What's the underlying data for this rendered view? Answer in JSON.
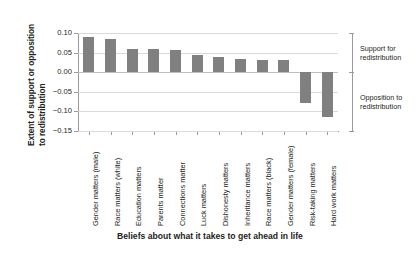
{
  "chart_data": {
    "type": "bar",
    "title": "",
    "subtitle": "",
    "xlabel": "Beliefs about what it takes to get ahead in life",
    "ylabel": "Extent of support or opposition to redistribution",
    "ylabel_lines": [
      "Extent of support or opposition",
      "to redistribution"
    ],
    "categories": [
      "Gender matters (male)",
      "Race matters (white)",
      "Education matters",
      "Parents matter",
      "Connections matter",
      "Luck matters",
      "Dishonesty matters",
      "Inheritance matters",
      "Race matters (black)",
      "Gender matters (female)",
      "Risk-taking matters",
      "Hard work matters"
    ],
    "values": [
      0.09,
      0.085,
      0.06,
      0.058,
      0.057,
      0.044,
      0.038,
      0.033,
      0.032,
      0.031,
      -0.078,
      -0.115
    ],
    "ylim": [
      -0.15,
      0.1
    ],
    "yticks": [
      0.1,
      0.05,
      0.0,
      -0.05,
      -0.1,
      -0.15
    ],
    "ytick_labels": [
      "0.10",
      "0.05",
      "0.00",
      "−0.05",
      "−0.10",
      "−0.15"
    ],
    "grid": true,
    "legend": "none",
    "bar_color": "#808080",
    "grid_color": "#d9d9d9",
    "axis_color": "#9a9a9a",
    "annotations": [
      {
        "id": "support",
        "lines": [
          "Support for",
          "redistribution"
        ],
        "region": "positive"
      },
      {
        "id": "opposition",
        "lines": [
          "Opposition to",
          "redistribution"
        ],
        "region": "negative"
      }
    ]
  }
}
